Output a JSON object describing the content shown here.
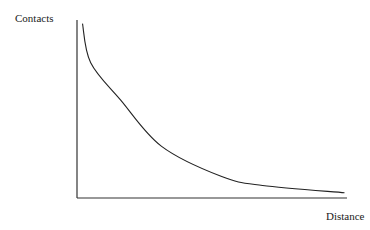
{
  "chart_data": {
    "type": "line",
    "title": "",
    "xlabel": "Distance",
    "ylabel": "Contacts",
    "grid": false,
    "legend": null,
    "ticks": {
      "x": [],
      "y": []
    },
    "series": [
      {
        "name": "Contacts vs Distance (distance decay)",
        "description": "Monotonically decreasing convex curve approaching zero asymptotically",
        "x": [
          0.02,
          0.05,
          0.16,
          0.31,
          0.53,
          0.68,
          0.98
        ],
        "y": [
          0.98,
          0.76,
          0.55,
          0.29,
          0.12,
          0.07,
          0.03
        ]
      }
    ],
    "xlim": [
      0,
      1
    ],
    "ylim": [
      0,
      1
    ],
    "color": "#222222"
  },
  "labels": {
    "y_axis": "Contacts",
    "x_axis": "Distance"
  }
}
